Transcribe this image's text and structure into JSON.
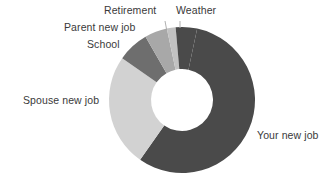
{
  "chart_data": {
    "type": "pie",
    "variant": "donut",
    "title": "",
    "subtitle": "",
    "xlabel": "",
    "ylabel": "",
    "legend_position": "none",
    "labels_position": "outside-with-leader-lines",
    "grid": false,
    "start_angle_deg": 0,
    "direction": "clockwise",
    "inner_radius_ratio": 0.42,
    "categories": [
      "Your new job",
      "Spouse new job",
      "School",
      "Parent new job",
      "Retirement",
      "Weather"
    ],
    "values": [
      56.4,
      25.0,
      6.9,
      5.0,
      2.2,
      4.5
    ],
    "units": "percent",
    "series": [
      {
        "name": "Reasons for moving",
        "values": [
          56.4,
          25.0,
          6.9,
          5.0,
          2.2,
          4.5
        ]
      }
    ],
    "slices": [
      {
        "label": "Your new job",
        "value": 56.4,
        "start_deg": 12,
        "end_deg": 215,
        "color": "#4a4a4a"
      },
      {
        "label": "Spouse new job",
        "value": 25.0,
        "start_deg": 215,
        "end_deg": 305,
        "color": "#d2d2d2"
      },
      {
        "label": "School",
        "value": 6.9,
        "start_deg": 305,
        "end_deg": 330,
        "color": "#6e6e6e"
      },
      {
        "label": "Parent new job",
        "value": 5.0,
        "start_deg": 330,
        "end_deg": 348,
        "color": "#a8a8a8"
      },
      {
        "label": "Retirement",
        "value": 2.2,
        "start_deg": 348,
        "end_deg": 355,
        "color": "#c2c2c2"
      },
      {
        "label": "Weather",
        "value": 4.5,
        "start_deg": 355,
        "end_deg": 372,
        "color": "#4a4a4a"
      }
    ],
    "geometry": {
      "center_x": 182,
      "center_y": 100,
      "outer_radius": 73,
      "inner_radius": 31
    }
  },
  "labels": {
    "weather": "Weather",
    "retirement": "Retirement",
    "parent_new_job": "Parent new job",
    "school": "School",
    "spouse_new_job": "Spouse new job",
    "your_new_job": "Your new job"
  },
  "colors": {
    "background": "#ffffff",
    "text": "#3a3a3a",
    "leader_line": "#b0b0b0",
    "dark": "#4a4a4a",
    "medium": "#6e6e6e",
    "light_medium": "#a8a8a8",
    "light": "#c2c2c2",
    "lightest": "#d2d2d2"
  }
}
